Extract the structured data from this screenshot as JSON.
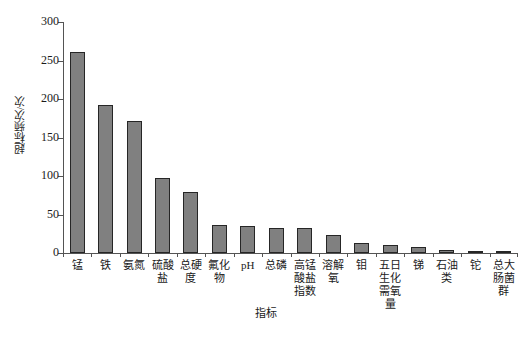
{
  "chart_data": {
    "type": "bar",
    "title": "",
    "xlabel": "指标",
    "ylabel": "超标频次/次",
    "ylim": [
      0,
      300
    ],
    "yticks": [
      0,
      50,
      100,
      150,
      200,
      250,
      300
    ],
    "grid": false,
    "legend": null,
    "bar_color": "#808080",
    "bar_edge_color": "#262626",
    "axis_color": "#545454",
    "categories": [
      "锰",
      "铁",
      "氨氮",
      "硫酸盐",
      "总硬度",
      "氟化物",
      "pH",
      "总磷",
      "高锰酸盐指数",
      "溶解氧",
      "钼",
      "五日生化需氧量",
      "锑",
      "石油类",
      "铊",
      "总大肠菌群"
    ],
    "values": [
      261,
      192,
      171,
      97,
      79,
      37,
      35,
      33,
      32,
      24,
      13,
      11,
      8,
      4,
      2,
      1
    ]
  }
}
